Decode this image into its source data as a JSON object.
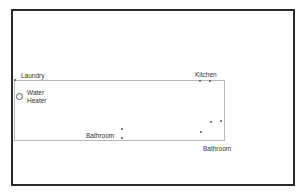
{
  "diagram": {
    "type": "floor-plan-plumbing-layout",
    "outer_border_color": "#2a2a2a",
    "inner_outline_color": "#b8b8b8",
    "labels": {
      "laundry": "Laundry",
      "water_heater_line1": "Water",
      "water_heater_line2": "Heater",
      "kitchen": "Kitchen",
      "bathroom_left": "Bathroom",
      "bathroom_right": "Bathroom"
    },
    "fixtures": [
      {
        "name": "laundry-fixture",
        "x": 15,
        "y": 80
      },
      {
        "name": "kitchen-fixture-1",
        "x": 200,
        "y": 81
      },
      {
        "name": "kitchen-fixture-2",
        "x": 210,
        "y": 81
      },
      {
        "name": "bathroom-right-fixture-1",
        "x": 211,
        "y": 122
      },
      {
        "name": "bathroom-right-fixture-2",
        "x": 221,
        "y": 121
      },
      {
        "name": "bathroom-right-fixture-3",
        "x": 201,
        "y": 132
      },
      {
        "name": "bathroom-left-fixture-1",
        "x": 122,
        "y": 129
      },
      {
        "name": "bathroom-left-fixture-2",
        "x": 122,
        "y": 138
      }
    ]
  }
}
